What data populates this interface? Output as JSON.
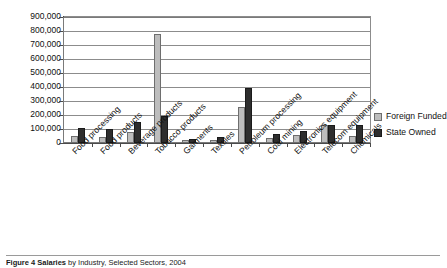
{
  "chart_data": {
    "type": "bar",
    "title": "",
    "xlabel": "",
    "ylabel": "",
    "ylim": [
      0,
      900000
    ],
    "ytick_step": 100000,
    "grid": true,
    "legend_position": "right",
    "categories": [
      "Food processing",
      "Food products",
      "Beverage products",
      "Tobacco products",
      "Garments",
      "Textiles",
      "Petroleum processing",
      "Coal mining",
      "Electronics equipment",
      "Telecom equipment",
      "Chemicals"
    ],
    "ytick_labels": [
      "900,000",
      "800,000",
      "700,000",
      "600,000",
      "500,000",
      "400,000",
      "300,000",
      "200,000",
      "100,000",
      "0"
    ],
    "series": [
      {
        "name": "Foreign Funded",
        "color": "#bdbdbd",
        "values": [
          50000,
          43000,
          80000,
          780000,
          22000,
          20000,
          255000,
          33000,
          57000,
          130000,
          50000
        ]
      },
      {
        "name": "State Owned",
        "color": "#2e2e2e",
        "values": [
          108000,
          97000,
          150000,
          190000,
          28000,
          42000,
          395000,
          62000,
          85000,
          125000,
          130000
        ]
      }
    ]
  },
  "legend": {
    "items": [
      {
        "label": "Foreign Funded",
        "marker": "square-light-gray"
      },
      {
        "label": "State Owned",
        "marker": "square-dark"
      }
    ]
  },
  "caption": {
    "prefix": "Figure 4 Salaries",
    "rest": " by Industry, Selected Sectors, 2004"
  }
}
